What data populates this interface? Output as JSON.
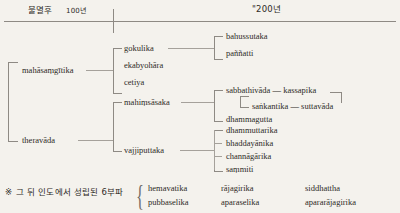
{
  "header": {
    "left_label": "불멸후",
    "left_value": "100년",
    "right_label": "\"200년"
  },
  "tree": {
    "roots": [
      {
        "label": "mahāsaṃgītika"
      },
      {
        "label": "theravāda"
      }
    ],
    "level2": [
      {
        "label": "gokulika"
      },
      {
        "label": "ekabyohāra"
      },
      {
        "label": "cetiya"
      },
      {
        "label": "mahiṃsāsaka"
      },
      {
        "label": "vajjiputtaka"
      }
    ],
    "gokulika_children": [
      {
        "label": "bahussutaka"
      },
      {
        "label": "paññatti"
      }
    ],
    "mahimsasaka_children": [
      {
        "label": "sabbathivāda",
        "sep": "—",
        "label2": "kassapika"
      },
      {
        "label": "saṅkantika",
        "sep": "—",
        "label2": "suttavāda"
      },
      {
        "label": "dhammagutta"
      }
    ],
    "vajjiputtaka_children": [
      {
        "label": "dhammuttarika"
      },
      {
        "label": "bhaddayānika"
      },
      {
        "label": "channāgārika"
      },
      {
        "label": "saṃmiti"
      }
    ]
  },
  "footnote": {
    "marker": "※",
    "text": "그 뒤 인도에서 성립된 6부파",
    "sects": [
      [
        "hemavatika",
        "rājagirika",
        "siddhattha"
      ],
      [
        "pubbaselika",
        "aparaselika",
        "apararājagirika"
      ]
    ]
  }
}
